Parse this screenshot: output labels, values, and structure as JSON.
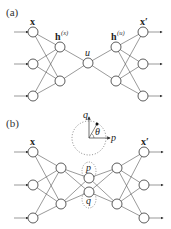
{
  "panels": [
    {
      "label": "(a)",
      "input_label": "x",
      "hidden_enc_label": "h",
      "hidden_enc_sup": "(x)",
      "latent_label": "u",
      "hidden_dec_label": "h",
      "hidden_dec_sup": "(u)",
      "output_label": "x′"
    },
    {
      "label": "(b)",
      "input_label": "x",
      "output_label": "x′",
      "latent_labels": [
        "p",
        "q"
      ],
      "phase_axis_p": "p",
      "phase_axis_q": "q",
      "phase_angle": "θ"
    }
  ],
  "colors": {
    "line": "#555555",
    "node_fill": "#ffffff",
    "node_stroke": "#333333",
    "dotted": "#666666"
  }
}
